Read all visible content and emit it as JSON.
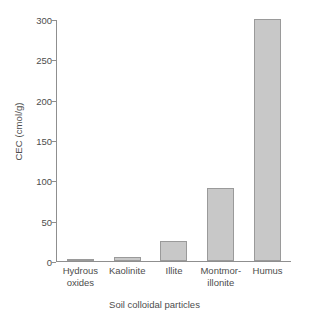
{
  "chart_data": {
    "type": "bar",
    "title": "",
    "categories": [
      "Hydrous oxides",
      "Kaolinite",
      "Illite",
      "Montmorillonite",
      "Humus"
    ],
    "category_lines": [
      [
        "Hydrous",
        "oxides"
      ],
      [
        "Kaolinite",
        ""
      ],
      [
        "Illite",
        ""
      ],
      [
        "Montmor-",
        "illonite"
      ],
      [
        "Humus",
        ""
      ]
    ],
    "values": [
      3,
      5,
      25,
      90,
      300
    ],
    "xlabel": "Soil colloidal particles",
    "ylabel": "CEC (cmol/g)",
    "ylim": [
      0,
      300
    ],
    "yticks": [
      0,
      50,
      100,
      150,
      200,
      250,
      300
    ],
    "ytick_labels": [
      "0",
      "50",
      "100",
      "150",
      "200",
      "250",
      "300"
    ],
    "grid": false,
    "legend": false,
    "bar_color": "#c8c8c8",
    "bar_border_color": "#9a9a9a",
    "axis_color": "#8f8f8f",
    "text_color": "#4d4d4d",
    "background": "#ffffff"
  }
}
